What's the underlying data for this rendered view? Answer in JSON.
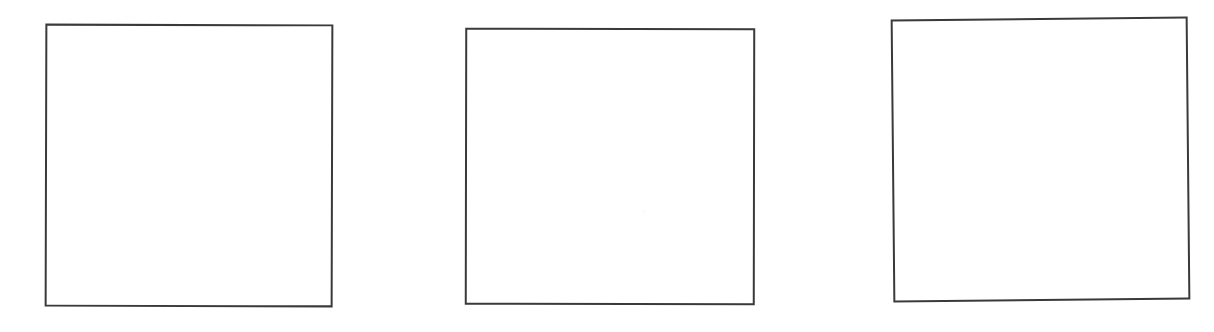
{
  "figure": {
    "background_color": "#ffffff",
    "canvas_width": 1214,
    "canvas_height": 332,
    "caption": "",
    "panel_count": 3,
    "panels": [
      {
        "id": "panel-1",
        "label": "",
        "content": "",
        "border_color": "#3a3a3a",
        "border_width": 2,
        "fill_color": "#ffffff",
        "x": 45,
        "y": 24,
        "width": 288,
        "height": 283,
        "rotation_deg": 0.15,
        "empty": true
      },
      {
        "id": "panel-2",
        "label": "",
        "content": "",
        "border_color": "#3a3a3a",
        "border_width": 2,
        "fill_color": "#ffffff",
        "x": 465,
        "y": 28,
        "width": 290,
        "height": 277,
        "rotation_deg": 0.1,
        "empty": true
      },
      {
        "id": "panel-3",
        "label": "",
        "content": "",
        "border_color": "#3a3a3a",
        "border_width": 2,
        "fill_color": "#ffffff",
        "x": 892,
        "y": 18,
        "width": 297,
        "height": 283,
        "rotation_deg": -0.55,
        "empty": true
      }
    ],
    "artifacts": [
      {
        "id": "speckle-1",
        "x": 176,
        "y": 180,
        "size": 3,
        "color": "#fafafa"
      }
    ]
  }
}
